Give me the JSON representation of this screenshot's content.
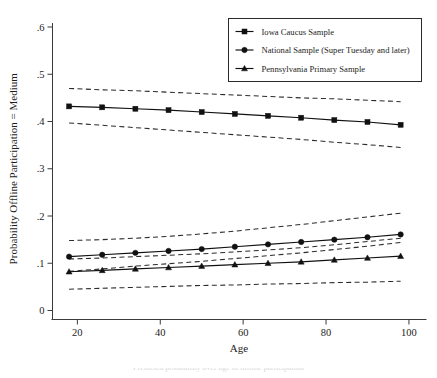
{
  "chart_data": {
    "type": "line",
    "title": "",
    "xlabel": "Age",
    "ylabel": "Probability Offline Participation = Medium",
    "xlim": [
      14,
      104
    ],
    "ylim": [
      0,
      0.6
    ],
    "grid": false,
    "legend_position": "top-right",
    "xticks": [
      20,
      40,
      60,
      80,
      100
    ],
    "xtick_labels": [
      "20",
      "40",
      "60",
      "80",
      "100"
    ],
    "yticks": [
      0,
      0.1,
      0.2,
      0.3,
      0.4,
      0.5,
      0.6
    ],
    "ytick_labels": [
      "0",
      ".1",
      ".2",
      ".3",
      ".4",
      ".5",
      ".6"
    ],
    "x": [
      18,
      26,
      34,
      42,
      50,
      58,
      66,
      74,
      82,
      90,
      98
    ],
    "series": [
      {
        "name": "Iowa Caucus Sample",
        "marker": "square",
        "values": [
          0.432,
          0.43,
          0.427,
          0.424,
          0.42,
          0.416,
          0.412,
          0.408,
          0.403,
          0.399,
          0.393
        ],
        "ci_upper": [
          0.47,
          0.467,
          0.465,
          0.462,
          0.459,
          0.456,
          0.453,
          0.45,
          0.448,
          0.445,
          0.442
        ],
        "ci_lower": [
          0.397,
          0.392,
          0.387,
          0.382,
          0.377,
          0.372,
          0.367,
          0.362,
          0.356,
          0.351,
          0.345
        ]
      },
      {
        "name": "National Sample (Super Tuesday and later)",
        "marker": "circle",
        "values": [
          0.114,
          0.118,
          0.122,
          0.126,
          0.13,
          0.135,
          0.14,
          0.145,
          0.15,
          0.155,
          0.161
        ],
        "ci_upper": [
          0.148,
          0.15,
          0.153,
          0.157,
          0.162,
          0.168,
          0.175,
          0.182,
          0.19,
          0.198,
          0.206
        ],
        "ci_lower": [
          0.083,
          0.088,
          0.094,
          0.099,
          0.104,
          0.11,
          0.116,
          0.122,
          0.129,
          0.136,
          0.144
        ]
      },
      {
        "name": "Pennsylvania Primary Sample",
        "marker": "triangle",
        "values": [
          0.082,
          0.085,
          0.088,
          0.091,
          0.094,
          0.097,
          0.1,
          0.103,
          0.107,
          0.111,
          0.115
        ],
        "ci_upper": [
          0.109,
          0.111,
          0.114,
          0.117,
          0.12,
          0.124,
          0.128,
          0.133,
          0.139,
          0.146,
          0.153
        ],
        "ci_lower": [
          0.045,
          0.047,
          0.049,
          0.051,
          0.053,
          0.054,
          0.056,
          0.057,
          0.059,
          0.06,
          0.062
        ]
      }
    ]
  },
  "legend": {
    "items": [
      {
        "label": "Iowa Caucus Sample",
        "marker": "square"
      },
      {
        "label": "National Sample (Super Tuesday and later)",
        "marker": "circle"
      },
      {
        "label": "Pennsylvania Primary Sample",
        "marker": "triangle"
      }
    ]
  },
  "caption": {
    "text": "Predicted probability over age of offline participation"
  }
}
